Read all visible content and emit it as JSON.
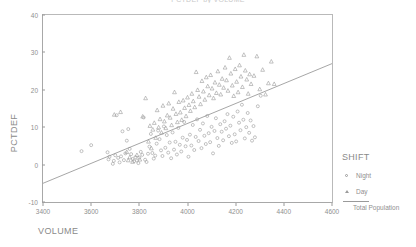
{
  "title": "PCTDEF by VOLUME",
  "axes": {
    "ylabel": "PCTDEF",
    "xlabel": "VOLUME"
  },
  "legend": {
    "title": "SHIFT",
    "night_label": "Night",
    "day_label": "Day",
    "line_label": "Total Population",
    "night_marker": "circle-marker-icon",
    "day_marker": "triangle-marker-icon",
    "line_marker": "regression-line-icon"
  },
  "chart_data": {
    "type": "scatter",
    "title": "PCTDEF by VOLUME",
    "xlabel": "VOLUME",
    "ylabel": "PCTDEF",
    "xlim": [
      3400,
      4600
    ],
    "ylim": [
      -10,
      40
    ],
    "xticks": [
      3400,
      3600,
      3800,
      4000,
      4200,
      4400,
      4600
    ],
    "yticks": [
      -10,
      0,
      10,
      20,
      30,
      40
    ],
    "grid": false,
    "legend_position": "right",
    "marker_color": "#9b9b9b",
    "line_color": "#8f8f8f",
    "trendline": {
      "name": "Total Population",
      "x": [
        3400,
        4600
      ],
      "y": [
        -5.0,
        27.0
      ],
      "slope": 0.02667,
      "intercept": -95.67
    },
    "series": [
      {
        "name": "Night",
        "marker": "circle",
        "points": [
          [
            3560,
            3.6
          ],
          [
            3600,
            5.2
          ],
          [
            3668,
            3.3
          ],
          [
            3672,
            1.4
          ],
          [
            3676,
            2.1
          ],
          [
            3690,
            0.2
          ],
          [
            3694,
            1.0
          ],
          [
            3700,
            2.5
          ],
          [
            3706,
            13.2
          ],
          [
            3712,
            1.8
          ],
          [
            3718,
            0.6
          ],
          [
            3724,
            2.2
          ],
          [
            3730,
            8.9
          ],
          [
            3736,
            1.2
          ],
          [
            3742,
            3.0
          ],
          [
            3748,
            6.4
          ],
          [
            3754,
            9.5
          ],
          [
            3760,
            4.2
          ],
          [
            3766,
            2.8
          ],
          [
            3772,
            1.5
          ],
          [
            3778,
            0.9
          ],
          [
            3784,
            2.0
          ],
          [
            3790,
            1.1
          ],
          [
            3796,
            0.4
          ],
          [
            3800,
            1.9
          ],
          [
            3806,
            3.4
          ],
          [
            3812,
            2.6
          ],
          [
            3818,
            12.6
          ],
          [
            3824,
            1.3
          ],
          [
            3830,
            0.7
          ],
          [
            3836,
            2.9
          ],
          [
            3842,
            4.8
          ],
          [
            3848,
            8.2
          ],
          [
            3854,
            3.1
          ],
          [
            3860,
            1.6
          ],
          [
            3866,
            2.4
          ],
          [
            3872,
            5.6
          ],
          [
            3878,
            9.1
          ],
          [
            3884,
            6.8
          ],
          [
            3890,
            3.8
          ],
          [
            3896,
            2.3
          ],
          [
            3902,
            10.2
          ],
          [
            3908,
            4.5
          ],
          [
            3914,
            7.9
          ],
          [
            3920,
            3.2
          ],
          [
            3926,
            5.9
          ],
          [
            3932,
            1.7
          ],
          [
            3938,
            8.6
          ],
          [
            3944,
            4.0
          ],
          [
            3950,
            6.1
          ],
          [
            3956,
            2.7
          ],
          [
            3962,
            9.8
          ],
          [
            3968,
            5.3
          ],
          [
            3974,
            3.5
          ],
          [
            3980,
            7.2
          ],
          [
            3986,
            11.4
          ],
          [
            3992,
            4.9
          ],
          [
            3998,
            6.6
          ],
          [
            4004,
            2.1
          ],
          [
            4010,
            8.0
          ],
          [
            4016,
            5.1
          ],
          [
            4022,
            10.6
          ],
          [
            4028,
            3.9
          ],
          [
            4034,
            7.4
          ],
          [
            4040,
            12.1
          ],
          [
            4046,
            6.3
          ],
          [
            4052,
            9.3
          ],
          [
            4058,
            4.4
          ],
          [
            4064,
            11.0
          ],
          [
            4070,
            7.7
          ],
          [
            4076,
            5.5
          ],
          [
            4082,
            13.0
          ],
          [
            4088,
            8.4
          ],
          [
            4094,
            6.0
          ],
          [
            4100,
            10.1
          ],
          [
            4106,
            3.0
          ],
          [
            4112,
            9.0
          ],
          [
            4118,
            12.4
          ],
          [
            4124,
            7.1
          ],
          [
            4130,
            5.0
          ],
          [
            4136,
            10.8
          ],
          [
            4142,
            8.8
          ],
          [
            4148,
            6.5
          ],
          [
            4154,
            11.6
          ],
          [
            4160,
            9.6
          ],
          [
            4166,
            13.5
          ],
          [
            4172,
            7.6
          ],
          [
            4178,
            10.4
          ],
          [
            4184,
            5.8
          ],
          [
            4190,
            12.8
          ],
          [
            4196,
            8.1
          ],
          [
            4202,
            6.2
          ],
          [
            4208,
            14.2
          ],
          [
            4214,
            11.2
          ],
          [
            4220,
            9.2
          ],
          [
            4226,
            16.0
          ],
          [
            4232,
            12.0
          ],
          [
            4238,
            7.0
          ],
          [
            4244,
            10.0
          ],
          [
            4250,
            13.8
          ],
          [
            4256,
            8.5
          ],
          [
            4262,
            11.8
          ],
          [
            4268,
            6.4
          ],
          [
            4274,
            10.3
          ],
          [
            4280,
            7.3
          ],
          [
            4292,
            15.6
          ],
          [
            4304,
            18.4
          ]
        ]
      },
      {
        "name": "Day",
        "marker": "triangle",
        "points": [
          [
            3696,
            13.4
          ],
          [
            3722,
            14.1
          ],
          [
            3748,
            3.4
          ],
          [
            3754,
            1.2
          ],
          [
            3760,
            2.0
          ],
          [
            3772,
            0.8
          ],
          [
            3790,
            2.6
          ],
          [
            3802,
            1.4
          ],
          [
            3814,
            12.9
          ],
          [
            3826,
            17.8
          ],
          [
            3838,
            6.2
          ],
          [
            3844,
            10.4
          ],
          [
            3850,
            4.4
          ],
          [
            3856,
            9.4
          ],
          [
            3862,
            11.2
          ],
          [
            3868,
            7.2
          ],
          [
            3874,
            14.6
          ],
          [
            3880,
            10.0
          ],
          [
            3886,
            12.2
          ],
          [
            3892,
            8.6
          ],
          [
            3898,
            15.8
          ],
          [
            3904,
            11.6
          ],
          [
            3910,
            9.8
          ],
          [
            3916,
            13.2
          ],
          [
            3922,
            16.4
          ],
          [
            3928,
            12.6
          ],
          [
            3934,
            10.6
          ],
          [
            3940,
            15.0
          ],
          [
            3946,
            19.4
          ],
          [
            3952,
            13.6
          ],
          [
            3958,
            11.4
          ],
          [
            3964,
            16.8
          ],
          [
            3970,
            14.0
          ],
          [
            3976,
            12.0
          ],
          [
            3982,
            17.2
          ],
          [
            3988,
            15.2
          ],
          [
            3994,
            13.0
          ],
          [
            4000,
            18.0
          ],
          [
            4006,
            16.0
          ],
          [
            4012,
            14.4
          ],
          [
            4018,
            19.0
          ],
          [
            4024,
            17.0
          ],
          [
            4030,
            15.4
          ],
          [
            4036,
            24.8
          ],
          [
            4042,
            20.0
          ],
          [
            4048,
            18.2
          ],
          [
            4054,
            16.2
          ],
          [
            4060,
            22.4
          ],
          [
            4066,
            19.6
          ],
          [
            4072,
            17.4
          ],
          [
            4078,
            23.4
          ],
          [
            4084,
            21.0
          ],
          [
            4090,
            18.6
          ],
          [
            4096,
            24.0
          ],
          [
            4102,
            20.4
          ],
          [
            4108,
            17.8
          ],
          [
            4114,
            22.0
          ],
          [
            4120,
            19.2
          ],
          [
            4126,
            25.0
          ],
          [
            4132,
            21.4
          ],
          [
            4138,
            18.8
          ],
          [
            4144,
            23.0
          ],
          [
            4150,
            20.6
          ],
          [
            4156,
            26.0
          ],
          [
            4162,
            22.6
          ],
          [
            4168,
            19.8
          ],
          [
            4174,
            28.6
          ],
          [
            4180,
            24.4
          ],
          [
            4186,
            21.2
          ],
          [
            4192,
            18.4
          ],
          [
            4198,
            25.6
          ],
          [
            4204,
            22.2
          ],
          [
            4210,
            19.4
          ],
          [
            4216,
            26.6
          ],
          [
            4222,
            23.6
          ],
          [
            4228,
            20.8
          ],
          [
            4234,
            29.4
          ],
          [
            4240,
            25.2
          ],
          [
            4246,
            22.8
          ],
          [
            4252,
            19.0
          ],
          [
            4258,
            24.2
          ],
          [
            4264,
            21.6
          ],
          [
            4276,
            23.8
          ],
          [
            4288,
            29.0
          ],
          [
            4300,
            20.2
          ],
          [
            4312,
            25.4
          ],
          [
            4324,
            18.8
          ],
          [
            4336,
            21.8
          ],
          [
            4348,
            27.6
          ],
          [
            4360,
            21.6
          ]
        ]
      }
    ]
  }
}
